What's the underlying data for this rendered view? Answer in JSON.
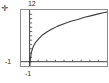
{
  "figure": {
    "corner_mark": "✛",
    "frame_color": "#8c8c8c",
    "background_color": "#ffffff",
    "curve_color": "#3c3c3c",
    "axis_color": "#404040"
  },
  "chart_data": {
    "type": "line",
    "title": "",
    "xlabel": "",
    "ylabel": "",
    "xlim": [
      -1,
      9
    ],
    "ylim": [
      -1,
      12
    ],
    "grid": false,
    "legend": null,
    "axis_tick_labels": {
      "y_max": "12",
      "y_min": "-1",
      "x_min": "-1"
    },
    "x_tick_count": 10,
    "y_tick_count": 13,
    "series": [
      {
        "name": "curve",
        "x": [
          0.02,
          0.08,
          0.2,
          0.4,
          0.7,
          1.0,
          1.5,
          2.0,
          2.6,
          3.2,
          4.0,
          4.8,
          5.6,
          6.4,
          7.2,
          8.0,
          8.7,
          9.0
        ],
        "y": [
          -1.0,
          0.6,
          2.1,
          3.4,
          4.5,
          5.2,
          6.2,
          6.9,
          7.6,
          8.2,
          8.8,
          9.4,
          9.8,
          10.3,
          10.7,
          11.1,
          11.4,
          11.5
        ]
      }
    ]
  }
}
